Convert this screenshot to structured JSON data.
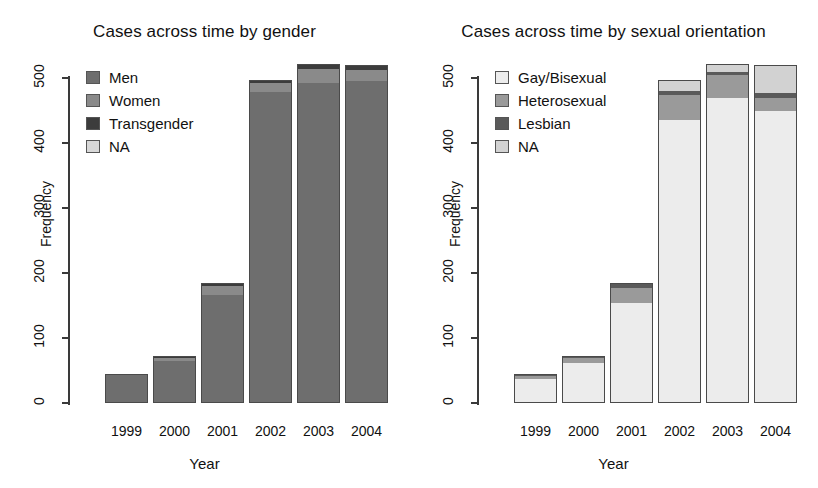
{
  "chart_data": [
    {
      "id": "gender",
      "type": "bar",
      "stacked": true,
      "title": "Cases across time by gender",
      "xlabel": "Year",
      "ylabel": "Frequency",
      "categories": [
        "1999",
        "2000",
        "2001",
        "2002",
        "2003",
        "2004"
      ],
      "yticks": [
        "0",
        "100",
        "200",
        "300",
        "400",
        "500"
      ],
      "ylim": [
        0,
        530
      ],
      "grid": false,
      "legend_position": "top-left",
      "series": [
        {
          "name": "Men",
          "color": "#6e6e6e",
          "values": [
            44,
            66,
            168,
            480,
            494,
            497
          ]
        },
        {
          "name": "Women",
          "color": "#8a8a8a",
          "values": [
            1,
            5,
            13,
            14,
            22,
            17
          ]
        },
        {
          "name": "Transgender",
          "color": "#3c3c3c",
          "values": [
            0,
            1,
            4,
            3,
            6,
            6
          ]
        },
        {
          "name": "NA",
          "color": "#d8d8d8",
          "values": [
            0,
            0,
            0,
            0,
            0,
            0
          ]
        }
      ],
      "totals": [
        45,
        72,
        185,
        497,
        522,
        520
      ]
    },
    {
      "id": "orientation",
      "type": "bar",
      "stacked": true,
      "title": "Cases across time by sexual orientation",
      "xlabel": "Year",
      "ylabel": "Frequency",
      "categories": [
        "1999",
        "2000",
        "2001",
        "2002",
        "2003",
        "2004"
      ],
      "yticks": [
        "0",
        "100",
        "200",
        "300",
        "400",
        "500"
      ],
      "ylim": [
        0,
        530
      ],
      "grid": false,
      "legend_position": "top-left",
      "series": [
        {
          "name": "Gay/Bisexual",
          "color": "#ececec",
          "values": [
            38,
            62,
            155,
            437,
            470,
            450
          ]
        },
        {
          "name": "Heterosexual",
          "color": "#9a9a9a",
          "values": [
            5,
            8,
            24,
            38,
            36,
            21
          ]
        },
        {
          "name": "Lesbian",
          "color": "#5a5a5a",
          "values": [
            2,
            2,
            6,
            6,
            5,
            7
          ]
        },
        {
          "name": "NA",
          "color": "#d2d2d2",
          "values": [
            0,
            0,
            0,
            16,
            11,
            42
          ]
        }
      ],
      "totals": [
        45,
        72,
        185,
        497,
        522,
        520
      ]
    }
  ]
}
